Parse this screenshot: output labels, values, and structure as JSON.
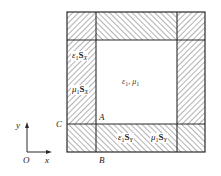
{
  "diagram": {
    "type": "pml-absorbing-layer-schematic",
    "colors": {
      "line": "#2a2a2a",
      "hatch": "#555555",
      "background": "#ffffff"
    },
    "regions": {
      "interior": {
        "eps": "ε",
        "eps_sub": "1",
        "sep": ",",
        "mu": "μ",
        "mu_sub": "1"
      },
      "left_layer": {
        "label1": {
          "sym": "ε",
          "sub": "1",
          "S": "S",
          "S_sub": "X"
        },
        "label2": {
          "sym": "μ",
          "sub": "1",
          "S": "S",
          "S_sub": "X"
        }
      },
      "bottom_layer": {
        "label1": {
          "sym": "ε",
          "sub": "1",
          "S": "S",
          "S_sub": "Y"
        },
        "label2": {
          "sym": "μ",
          "sub": "1",
          "S": "S",
          "S_sub": "Y"
        }
      }
    },
    "points": {
      "A": "A",
      "B": "B",
      "C": "C"
    },
    "axes": {
      "y": "y",
      "x": "x",
      "origin": "O"
    }
  }
}
